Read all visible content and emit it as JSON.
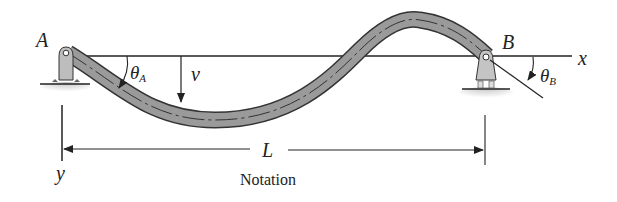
{
  "diagram": {
    "caption": "Notation",
    "labels": {
      "support_a": "A",
      "support_b": "B",
      "x_axis": "x",
      "y_axis": "y",
      "length": "L",
      "deflection": "v",
      "theta_a_symbol": "θ",
      "theta_a_sub": "A",
      "theta_b_symbol": "θ",
      "theta_b_sub": "B"
    },
    "colors": {
      "beam_fill": "#9a9a9a",
      "beam_outline": "#333333",
      "line": "#222222",
      "support_fill": "#bdbdbd",
      "ground_shade": "#d6d6d6"
    }
  }
}
